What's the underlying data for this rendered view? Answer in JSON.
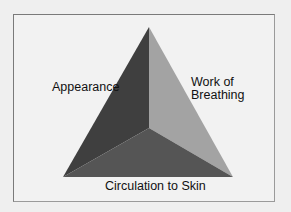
{
  "diagram": {
    "title": "",
    "labels": {
      "appearance": "Appearance",
      "work_of_breathing_line1": "Work of",
      "work_of_breathing_line2": "Breathing",
      "circulation": "Circulation to Skin"
    },
    "faces": [
      {
        "name": "Appearance",
        "color": "#3f3f3f"
      },
      {
        "name": "Work of Breathing",
        "color": "#a3a3a3"
      },
      {
        "name": "Circulation to Skin",
        "color": "#555555"
      }
    ],
    "background": "#f2f2f2"
  }
}
